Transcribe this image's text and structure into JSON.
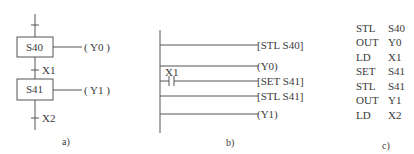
{
  "panel_a": {
    "label": "a)",
    "steps": [
      {
        "name": "S40",
        "output": "( Y0 )"
      },
      {
        "name": "S41",
        "output": "( Y1 )"
      }
    ],
    "transitions": [
      "X1",
      "X2"
    ]
  },
  "panel_b": {
    "label": "b)",
    "rungs": [
      {
        "contact": "",
        "instruction": "[STL S40]"
      },
      {
        "contact": "",
        "instruction": "(Y0)"
      },
      {
        "contact": "X1",
        "instruction": "[SET S41]"
      },
      {
        "contact": "",
        "instruction": "[STL S41]"
      },
      {
        "contact": "",
        "instruction": "(Y1)"
      }
    ]
  },
  "panel_c": {
    "label": "c)",
    "instructions": [
      {
        "op": "STL",
        "arg": "S40"
      },
      {
        "op": "OUT",
        "arg": "Y0"
      },
      {
        "op": "LD",
        "arg": "X1"
      },
      {
        "op": "SET",
        "arg": "S41"
      },
      {
        "op": "STL",
        "arg": "S41"
      },
      {
        "op": "OUT",
        "arg": "Y1"
      },
      {
        "op": "LD",
        "arg": "X2"
      }
    ]
  }
}
